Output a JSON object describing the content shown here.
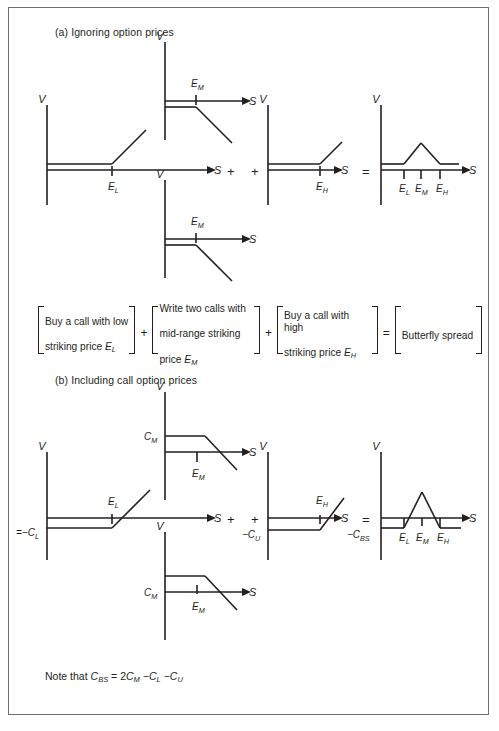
{
  "figure": {
    "panel_a": {
      "heading": "(a) Ignoring option prices",
      "diagrams": [
        {
          "name": "buy-call-low-strike",
          "v_axis_label": "V",
          "s_axis_label": "S",
          "ticks": [
            "E_L"
          ],
          "payoff": "long call, kink at E_L"
        },
        {
          "name": "write-call-mid-strike-1",
          "v_axis_label": "V",
          "s_axis_label": "S",
          "ticks": [
            "E_M"
          ],
          "payoff": "short call, kink at E_M"
        },
        {
          "name": "write-call-mid-strike-2",
          "v_axis_label": "V",
          "s_axis_label": "S",
          "ticks": [
            "E_M"
          ],
          "payoff": "short call, kink at E_M"
        },
        {
          "name": "buy-call-high-strike",
          "v_axis_label": "V",
          "s_axis_label": "S",
          "ticks": [
            "E_H"
          ],
          "payoff": "long call, kink at E_H"
        },
        {
          "name": "butterfly-spread-result",
          "v_axis_label": "V",
          "s_axis_label": "S",
          "ticks": [
            "E_L",
            "E_M",
            "E_H"
          ],
          "payoff": "butterfly, peak at E_M"
        }
      ],
      "operators": [
        "+",
        "+",
        "="
      ]
    },
    "panel_b": {
      "heading": "(b) Including call option prices",
      "diagrams": [
        {
          "name": "buy-call-low-strike-priced",
          "v_axis_label": "V",
          "s_axis_label": "S",
          "ticks": [
            "E_L"
          ],
          "value_label": "−C_L",
          "payoff": "long call net of premium, kink at E_L"
        },
        {
          "name": "write-call-mid-strike-priced-1",
          "v_axis_label": "V",
          "s_axis_label": "S",
          "ticks": [
            "E_M"
          ],
          "value_label": "C_M",
          "payoff": "short call plus premium, kink at E_M"
        },
        {
          "name": "write-call-mid-strike-priced-2",
          "v_axis_label": "V",
          "s_axis_label": "S",
          "ticks": [
            "E_M"
          ],
          "value_label": "C_M",
          "payoff": "short call plus premium, kink at E_M"
        },
        {
          "name": "buy-call-high-strike-priced",
          "v_axis_label": "V",
          "s_axis_label": "S",
          "ticks": [
            "E_H"
          ],
          "value_label": "−C_U",
          "payoff": "long call net of premium, kink at E_H"
        },
        {
          "name": "butterfly-spread-result-priced",
          "v_axis_label": "V",
          "s_axis_label": "S",
          "ticks": [
            "E_L",
            "E_M",
            "E_H"
          ],
          "value_label": "−C_BS",
          "payoff": "butterfly net of cost, peak at E_M"
        }
      ],
      "operators": [
        "+",
        "+",
        "="
      ]
    },
    "bracket_equation": {
      "terms": [
        {
          "line1": "Buy a call with low",
          "line2": "striking price ",
          "sym": "E",
          "sub": "L"
        },
        {
          "line1": "Write two calls with",
          "line2": "mid-range striking",
          "line3": "price ",
          "sym": "E",
          "sub": "M"
        },
        {
          "line1": "Buy a call with high",
          "line2": "striking price ",
          "sym": "E",
          "sub": "H"
        },
        {
          "line1": "Butterfly spread"
        }
      ],
      "operators": [
        "+",
        "+",
        "="
      ]
    },
    "note": {
      "prefix": "Note that ",
      "lhs_sym": "C",
      "lhs_sub": "BS",
      "eq": " = 2",
      "t1_sym": "C",
      "t1_sub": "M",
      "m1": " −",
      "t2_sym": "C",
      "t2_sub": "L",
      "m2": " −",
      "t3_sym": "C",
      "t3_sub": "U"
    },
    "colors": {
      "ink": "#231f20",
      "frame": "#6d6e71",
      "background": "#ffffff"
    },
    "symbols": {
      "V": "V",
      "S": "S",
      "E_L": "E",
      "E_L_sub": "L",
      "E_M": "E",
      "E_M_sub": "M",
      "E_H": "E",
      "E_H_sub": "H",
      "C_M": "C",
      "C_M_sub": "M",
      "C_L": "C",
      "C_L_sub": "L",
      "C_U": "C",
      "C_U_sub": "U",
      "C_BS": "C",
      "C_BS_sub": "BS",
      "minus": "−",
      "plus": "+",
      "equals": "="
    }
  }
}
